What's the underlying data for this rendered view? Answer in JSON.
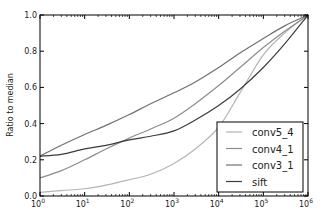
{
  "chart_data": {
    "type": "line",
    "title": "",
    "xlabel": "",
    "ylabel": "Ratio to median",
    "xscale": "log",
    "xlim": [
      1,
      1000000
    ],
    "ylim": [
      0.0,
      1.0
    ],
    "x_ticks": [
      {
        "value": 1,
        "base": "10",
        "exp": "0"
      },
      {
        "value": 10,
        "base": "10",
        "exp": "1"
      },
      {
        "value": 100,
        "base": "10",
        "exp": "2"
      },
      {
        "value": 1000,
        "base": "10",
        "exp": "3"
      },
      {
        "value": 10000,
        "base": "10",
        "exp": "4"
      },
      {
        "value": 100000,
        "base": "10",
        "exp": "5"
      },
      {
        "value": 1000000,
        "base": "10",
        "exp": "6"
      }
    ],
    "y_ticks": [
      {
        "value": 0.0,
        "label": "0.0"
      },
      {
        "value": 0.2,
        "label": "0.2"
      },
      {
        "value": 0.4,
        "label": "0.4"
      },
      {
        "value": 0.6,
        "label": "0.6"
      },
      {
        "value": 0.8,
        "label": "0.8"
      },
      {
        "value": 1.0,
        "label": "1.0"
      }
    ],
    "grid": false,
    "legend_position": "bottom-right",
    "x": [
      1,
      3,
      10,
      30,
      100,
      300,
      1000,
      3000,
      10000,
      30000,
      100000,
      300000,
      1000000
    ],
    "series": [
      {
        "name": "conv5_4",
        "color": "#b4b4b4",
        "values": [
          0.02,
          0.03,
          0.04,
          0.06,
          0.09,
          0.12,
          0.18,
          0.26,
          0.38,
          0.57,
          0.78,
          0.9,
          1.0
        ]
      },
      {
        "name": "conv4_1",
        "color": "#8c8c8c",
        "values": [
          0.1,
          0.14,
          0.2,
          0.26,
          0.32,
          0.37,
          0.43,
          0.51,
          0.61,
          0.71,
          0.82,
          0.91,
          1.0
        ]
      },
      {
        "name": "conv3_1",
        "color": "#707070",
        "values": [
          0.22,
          0.28,
          0.34,
          0.39,
          0.45,
          0.51,
          0.57,
          0.63,
          0.71,
          0.79,
          0.87,
          0.94,
          1.0
        ]
      },
      {
        "name": "sift",
        "color": "#3c3c3c",
        "values": [
          0.22,
          0.23,
          0.26,
          0.28,
          0.31,
          0.33,
          0.36,
          0.42,
          0.5,
          0.59,
          0.71,
          0.84,
          1.0
        ]
      }
    ]
  }
}
